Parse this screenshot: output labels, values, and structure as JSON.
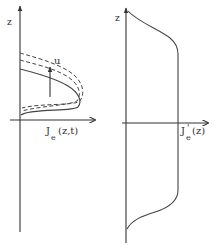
{
  "left_panel": {
    "y_axis_label": "z",
    "x_axis_label_main": "J",
    "x_axis_label_sub": "e",
    "x_axis_label_args": "(z,t)",
    "arrow_label": "u"
  },
  "right_panel": {
    "y_axis_label": "z",
    "x_axis_label_main": "J",
    "x_axis_label_prime": "'",
    "x_axis_label_sub": "e",
    "x_axis_label_args": "(z)"
  },
  "colors": {
    "line": "#444444",
    "text": "#333333",
    "background": "#ffffff"
  }
}
